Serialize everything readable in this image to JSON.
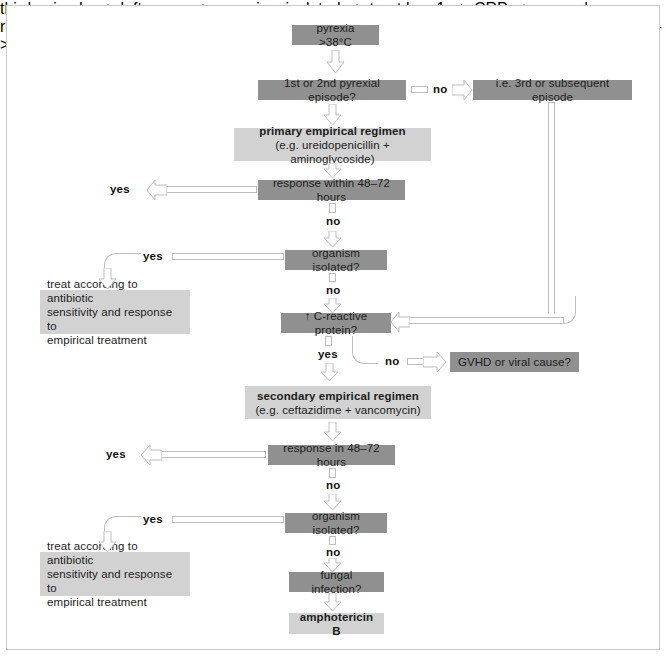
{
  "diagram": {
    "colors": {
      "node_dark": "#909090",
      "node_light": "#d2d2d2",
      "connector_stroke": "#bdbdbd",
      "frame_border": "#c9c9c9",
      "text": "#1c1c1c"
    },
    "nodes": {
      "pyrexia": {
        "text": "pyrexia  >38°C",
        "style": "dark"
      },
      "episode_question": {
        "text": "1st or 2nd pyrexial episode?",
        "style": "dark"
      },
      "third_episode": {
        "text": "i.e. 3rd or subsequent episode",
        "style": "dark"
      },
      "primary_regimen": {
        "title": "primary empirical regimen",
        "subtitle": "(e.g. ureidopenicillin + aminoglycoside)",
        "style": "light"
      },
      "response_primary": {
        "text": "response within 48–72 hours",
        "style": "dark"
      },
      "organism_isolated_1": {
        "text": "organism isolated?",
        "style": "dark"
      },
      "treat_antibiotic_1": {
        "line1": "treat according to antibiotic",
        "line2": "sensitivity and response to",
        "line3": "empirical treatment",
        "style": "light"
      },
      "crp": {
        "text": "↑ C-reactive protein?",
        "style": "dark"
      },
      "gvhd": {
        "text": "GVHD or viral cause?",
        "style": "dark"
      },
      "secondary_regimen": {
        "title": "secondary empirical regimen",
        "subtitle": "(e.g. ceftazidime + vancomycin)",
        "style": "light"
      },
      "response_secondary": {
        "text": "response in 48–72 hours",
        "style": "dark"
      },
      "organism_isolated_2": {
        "text": "organism isolated?",
        "style": "dark"
      },
      "treat_antibiotic_2": {
        "line1": "treat according to antibiotic",
        "line2": "sensitivity and response to",
        "line3": "empirical treatment",
        "style": "light"
      },
      "fungal": {
        "text": "fungal infection?",
        "style": "dark"
      },
      "amphotericin": {
        "text": "amphotericin B",
        "style": "light"
      }
    },
    "edge_labels": {
      "no_episode": "no",
      "yes_response_primary": "yes",
      "no_response_primary": "no",
      "yes_organism_1": "yes",
      "no_organism_1": "no",
      "yes_crp": "yes",
      "no_crp": "no",
      "yes_response_secondary": "yes",
      "no_response_secondary": "no",
      "yes_organism_2": "yes",
      "no_organism_2": "no"
    }
  }
}
